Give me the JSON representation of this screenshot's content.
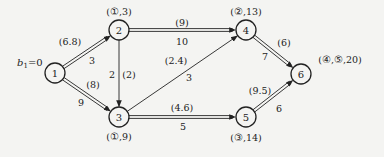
{
  "diagram": {
    "type": "network-shortest-path",
    "start_label": "b",
    "start_subscript": "1",
    "start_value": "=0",
    "colors": {
      "background": "#f4f4f2",
      "stroke": "#222222"
    },
    "nodes": [
      {
        "id": "1",
        "x": 55,
        "y": 73,
        "annotation": ""
      },
      {
        "id": "2",
        "x": 119,
        "y": 30,
        "annotation": "(①,3)",
        "ax": 119,
        "ay": 15
      },
      {
        "id": "3",
        "x": 119,
        "y": 117,
        "annotation": "(①,9)",
        "ax": 119,
        "ay": 140
      },
      {
        "id": "4",
        "x": 246,
        "y": 30,
        "annotation": "(②,13)",
        "ax": 246,
        "ay": 15
      },
      {
        "id": "5",
        "x": 246,
        "y": 117,
        "annotation": "(③,14)",
        "ax": 246,
        "ay": 141
      },
      {
        "id": "6",
        "x": 301,
        "y": 74,
        "annotation": "(④,⑤,20)",
        "ax": 340,
        "ay": 63
      }
    ],
    "edges": [
      {
        "from": "1",
        "to": "2",
        "double": true,
        "weight": "3",
        "flow": "(6.8)",
        "wx": 92,
        "wy": 64,
        "fx": 70,
        "fy": 45
      },
      {
        "from": "1",
        "to": "3",
        "double": true,
        "weight": "9",
        "flow": "(8)",
        "wx": 81,
        "wy": 106,
        "fx": 93,
        "fy": 88
      },
      {
        "from": "2",
        "to": "4",
        "double": true,
        "weight": "10",
        "flow": "(9)",
        "wx": 182,
        "wy": 45,
        "fx": 182,
        "fy": 26
      },
      {
        "from": "2",
        "to": "3",
        "double": false,
        "weight": "2",
        "flow": "(2)",
        "wx": 112,
        "wy": 78,
        "fx": 129,
        "fy": 78
      },
      {
        "from": "3",
        "to": "4",
        "double": false,
        "weight": "3",
        "flow": "(2.4)",
        "wx": 189,
        "wy": 81,
        "fx": 176,
        "fy": 64
      },
      {
        "from": "3",
        "to": "5",
        "double": true,
        "weight": "5",
        "flow": "(4.6)",
        "wx": 183,
        "wy": 130,
        "fx": 182,
        "fy": 111
      },
      {
        "from": "4",
        "to": "6",
        "double": true,
        "weight": "7",
        "flow": "(6)",
        "wx": 265,
        "wy": 60,
        "fx": 284,
        "fy": 46
      },
      {
        "from": "5",
        "to": "6",
        "double": true,
        "weight": "6",
        "flow": "(9.5)",
        "wx": 279,
        "wy": 112,
        "fx": 260,
        "fy": 94
      }
    ]
  }
}
